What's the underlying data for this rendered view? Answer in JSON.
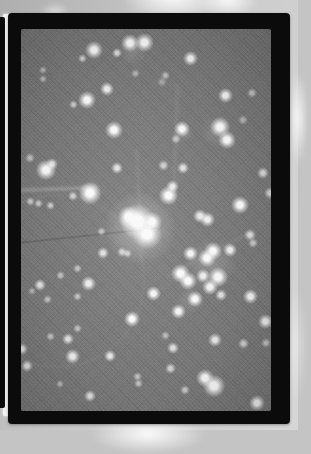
{
  "photo": {
    "description": "Black-framed astronomical photograph of a dense star field / star cluster with a bright central concentration, lying on a light gray page with glare highlights; the edge of an adjacent black-framed photo is visible along the left side",
    "colors": {
      "page1": "#aeaeae",
      "page2": "#c9c9c9",
      "gap": "#f3f3f3",
      "frame": "#0b0b0b",
      "field": "#767676",
      "star": "#ffffff"
    },
    "glare_spots": [
      {
        "x": 172,
        "y": -4,
        "rx": 52,
        "ry": 26,
        "o": 0.95
      },
      {
        "x": 228,
        "y": 0,
        "rx": 30,
        "ry": 18,
        "o": 0.9
      },
      {
        "x": 55,
        "y": 11,
        "rx": 15,
        "ry": 8,
        "o": 0.5
      },
      {
        "x": 148,
        "y": 434,
        "rx": 58,
        "ry": 20,
        "o": 0.95
      },
      {
        "x": 298,
        "y": 118,
        "rx": 10,
        "ry": 48,
        "o": 0.85
      },
      {
        "x": 296,
        "y": 345,
        "rx": 12,
        "ry": 60,
        "o": 0.4
      }
    ],
    "starfield": {
      "width": 250,
      "height": 382,
      "halos": [
        [
          119,
          199,
          36,
          0.4
        ],
        [
          69,
          164,
          13,
          0.3
        ],
        [
          25,
          141,
          11,
          0.22
        ],
        [
          147,
          166,
          10,
          0.2
        ],
        [
          190,
          235,
          26,
          0.18
        ],
        [
          193,
          357,
          12,
          0.25
        ],
        [
          112,
          22,
          14,
          0.15
        ],
        [
          196,
          102,
          16,
          0.15
        ],
        [
          162,
          103,
          10,
          0.18
        ],
        [
          170,
          271,
          14,
          0.15
        ]
      ],
      "stars": [
        [
          73,
          21,
          3.5,
          1
        ],
        [
          96,
          24,
          2,
          0.75
        ],
        [
          61,
          29,
          1.8,
          0.65
        ],
        [
          109,
          14,
          3.6,
          1
        ],
        [
          123,
          13,
          3.8,
          1
        ],
        [
          169,
          29,
          3,
          0.95
        ],
        [
          144,
          46,
          1.8,
          0.5
        ],
        [
          114,
          44,
          1.8,
          0.45
        ],
        [
          141,
          53,
          2,
          0.35
        ],
        [
          22,
          41,
          1.5,
          0.5
        ],
        [
          22,
          50,
          1.5,
          0.5
        ],
        [
          204,
          66,
          3,
          0.95
        ],
        [
          231,
          64,
          2,
          0.55
        ],
        [
          86,
          60,
          2.8,
          0.9
        ],
        [
          66,
          71,
          3.5,
          1
        ],
        [
          52,
          75,
          1.8,
          0.6
        ],
        [
          93,
          101,
          3.5,
          1
        ],
        [
          161,
          100,
          3.2,
          1
        ],
        [
          155,
          110,
          2,
          0.55
        ],
        [
          199,
          98,
          4,
          1
        ],
        [
          206,
          111,
          3.5,
          1
        ],
        [
          222,
          91,
          2,
          0.45
        ],
        [
          9,
          129,
          2,
          0.55
        ],
        [
          25,
          141,
          4,
          1
        ],
        [
          31,
          135,
          2.5,
          0.8
        ],
        [
          9,
          172,
          1.8,
          0.6
        ],
        [
          17,
          174,
          1.8,
          0.6
        ],
        [
          29,
          176,
          1.8,
          0.6
        ],
        [
          69,
          164,
          4.5,
          1
        ],
        [
          52,
          167,
          2,
          0.65
        ],
        [
          96,
          139,
          2.5,
          0.8
        ],
        [
          142,
          136,
          2.2,
          0.65
        ],
        [
          162,
          139,
          2.5,
          0.8
        ],
        [
          147,
          166,
          3.8,
          1
        ],
        [
          151,
          157,
          2.6,
          0.85
        ],
        [
          117,
          191,
          2.5,
          0.85
        ],
        [
          179,
          187,
          2.8,
          0.85
        ],
        [
          186,
          190,
          3,
          0.9
        ],
        [
          219,
          176,
          3.5,
          1
        ],
        [
          229,
          206,
          2.5,
          0.75
        ],
        [
          242,
          144,
          2.5,
          0.75
        ],
        [
          249,
          164,
          2.4,
          0.7
        ],
        [
          232,
          214,
          2,
          0.6
        ],
        [
          116,
          192,
          7,
          1
        ],
        [
          126,
          205,
          6,
          1
        ],
        [
          108,
          188,
          4.5,
          1
        ],
        [
          131,
          193,
          4,
          1
        ],
        [
          80,
          202,
          1.8,
          0.55
        ],
        [
          82,
          224,
          2.5,
          0.8
        ],
        [
          101,
          223,
          2,
          0.65
        ],
        [
          106,
          224,
          1.8,
          0.6
        ],
        [
          169,
          224,
          3,
          0.95
        ],
        [
          186,
          229,
          3.5,
          1
        ],
        [
          192,
          222,
          3.5,
          1
        ],
        [
          209,
          221,
          2.8,
          0.9
        ],
        [
          197,
          248,
          4,
          1
        ],
        [
          189,
          258,
          3.2,
          0.95
        ],
        [
          159,
          244,
          3.8,
          1
        ],
        [
          167,
          252,
          3.5,
          1
        ],
        [
          182,
          247,
          2.8,
          0.9
        ],
        [
          56,
          239,
          1.8,
          0.55
        ],
        [
          39,
          246,
          1.8,
          0.55
        ],
        [
          67,
          254,
          3,
          0.9
        ],
        [
          19,
          256,
          2.5,
          0.8
        ],
        [
          11,
          262,
          1.5,
          0.45
        ],
        [
          26,
          270,
          1.8,
          0.55
        ],
        [
          56,
          267,
          1.8,
          0.55
        ],
        [
          132,
          264,
          3,
          0.95
        ],
        [
          174,
          270,
          3.2,
          1
        ],
        [
          200,
          266,
          2.5,
          0.8
        ],
        [
          229,
          267,
          3,
          0.95
        ],
        [
          157,
          282,
          3,
          0.95
        ],
        [
          111,
          290,
          3.2,
          1
        ],
        [
          194,
          311,
          2.8,
          0.85
        ],
        [
          222,
          314,
          2.2,
          0.65
        ],
        [
          244,
          292,
          3,
          0.9
        ],
        [
          245,
          314,
          2,
          0.55
        ],
        [
          56,
          299,
          1.8,
          0.55
        ],
        [
          29,
          307,
          1.8,
          0.55
        ],
        [
          47,
          310,
          2.5,
          0.8
        ],
        [
          1,
          320,
          2.5,
          0.8
        ],
        [
          6,
          337,
          2.5,
          0.8
        ],
        [
          89,
          327,
          2.5,
          0.85
        ],
        [
          51,
          327,
          3,
          0.9
        ],
        [
          152,
          319,
          2.5,
          0.8
        ],
        [
          144,
          306,
          1.8,
          0.5
        ],
        [
          116,
          347,
          1.8,
          0.55
        ],
        [
          117,
          354,
          1.8,
          0.55
        ],
        [
          149,
          339,
          2.2,
          0.7
        ],
        [
          164,
          361,
          2,
          0.6
        ],
        [
          184,
          349,
          3.5,
          1
        ],
        [
          193,
          357,
          4.5,
          1
        ],
        [
          236,
          374,
          3.2,
          0.95
        ],
        [
          69,
          367,
          2.5,
          0.8
        ],
        [
          39,
          355,
          1.5,
          0.5
        ]
      ],
      "streaks": [
        {
          "x": -6,
          "y": 158,
          "w": 82,
          "h": 4,
          "rot": -2,
          "c": "rgba(255,255,255,0.20)",
          "b": 1.2
        },
        {
          "x": 153,
          "y": 55,
          "w": 3,
          "h": 120,
          "rot": 2,
          "c": "rgba(255,255,255,0.08)",
          "b": 1.5
        },
        {
          "x": 117,
          "y": 120,
          "w": 3,
          "h": 110,
          "rot": -3,
          "c": "rgba(255,255,255,0.07)",
          "b": 1.5
        },
        {
          "x": -12,
          "y": 206,
          "w": 150,
          "h": 2,
          "rot": -6,
          "c": "rgba(0,0,0,0.15)",
          "b": 0.5
        },
        {
          "x": 140,
          "y": 225,
          "w": 90,
          "h": 2.5,
          "rot": -28,
          "c": "rgba(255,255,255,0.07)",
          "b": 1.2
        }
      ],
      "arcs": [
        {
          "x": -50,
          "y": 165,
          "d": 170,
          "o": 0.06
        }
      ]
    }
  }
}
